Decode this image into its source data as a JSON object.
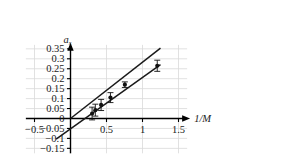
{
  "chart_data": {
    "type": "scatter",
    "title": "",
    "subtitle": "",
    "xlabel": "1/M",
    "ylabel": "a_s",
    "ylabel_base": "a",
    "ylabel_sub": "s",
    "xlim": [
      -0.62,
      1.62
    ],
    "ylim": [
      -0.175,
      0.37
    ],
    "grid": true,
    "legend": "none",
    "xticks": [
      -0.5,
      0.5,
      1,
      1.5
    ],
    "xticklabels": [
      "−0.5",
      "0.5",
      "1",
      "1.5"
    ],
    "yticks": [
      -0.15,
      -0.1,
      -0.05,
      0,
      0.05,
      0.1,
      0.15,
      0.2,
      0.25,
      0.3,
      0.35
    ],
    "yticklabels": [
      "−0.15",
      "−0.1",
      "−0.05",
      "0",
      "0.05",
      "0.1",
      "0.15",
      "0.2",
      "0.25",
      "0.3",
      "0.35"
    ],
    "xgridlines": [
      -0.5,
      0.5,
      1,
      1.5
    ],
    "ygridlines": [
      -0.15,
      -0.1,
      -0.05,
      0.05,
      0.1,
      0.15,
      0.2,
      0.25,
      0.3,
      0.35
    ],
    "points": [
      {
        "x": 0.3,
        "y": 0.025,
        "yerr": 0.032
      },
      {
        "x": 0.345,
        "y": 0.042,
        "yerr": 0.03
      },
      {
        "x": 0.425,
        "y": 0.068,
        "yerr": 0.028
      },
      {
        "x": 0.555,
        "y": 0.105,
        "yerr": 0.025
      },
      {
        "x": 0.755,
        "y": 0.17,
        "yerr": 0.014
      },
      {
        "x": 1.205,
        "y": 0.265,
        "yerr": 0.028
      }
    ],
    "series": [
      {
        "name": "upper fit line",
        "type": "line",
        "intercept": 0.0,
        "slope": 0.283,
        "x_start": 0.0,
        "x_end": 1.25,
        "y_start": 0.0,
        "y_end": 0.354
      },
      {
        "name": "lower fit line",
        "type": "line",
        "intercept": -0.052,
        "slope": 0.258,
        "x_start": -0.2,
        "x_end": 1.25,
        "y_start": -0.104,
        "y_end": 0.271
      }
    ],
    "colors": {
      "line": "#1a1a1a",
      "axis": "#000000",
      "grid": "#d9d9d9",
      "marker": "#111111",
      "background": "#ffffff"
    }
  }
}
